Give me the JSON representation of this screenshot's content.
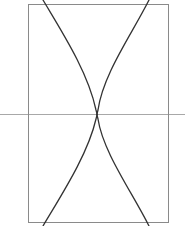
{
  "figure": {
    "canvas": {
      "width": 185,
      "height": 226,
      "background_color": "#ffffff"
    },
    "frame": {
      "name": "bounding-rectangle",
      "x": 28,
      "y": 4,
      "width": 140,
      "height": 218,
      "stroke_color": "#8a8a8a",
      "stroke_width": 1,
      "fill": "none"
    },
    "axis_line": {
      "name": "horizontal-axis",
      "x1": 0,
      "y1": 114.5,
      "x2": 185,
      "y2": 114.5,
      "stroke_color": "#a8a8a8",
      "stroke_width": 1
    },
    "waist": {
      "x": 97,
      "y": 114.5,
      "label": "crossing-point"
    },
    "curves": [
      {
        "name": "upper-left-arc",
        "stroke_color": "#333333",
        "stroke_width": 1.3,
        "path": "M 43 0 C 62 32 88 72 96 110 C 96.6 112 97 113.5 97 114.5"
      },
      {
        "name": "upper-right-arc",
        "stroke_color": "#333333",
        "stroke_width": 1.3,
        "path": "M 149 0 C 132 34 103 74 98 110 C 97.5 112 97 113.5 97 114.5"
      },
      {
        "name": "lower-left-arc",
        "stroke_color": "#333333",
        "stroke_width": 1.3,
        "path": "M 43 226 C 62 194 88 154 96 119 C 96.6 117 97 115.5 97 114.5"
      },
      {
        "name": "lower-right-arc",
        "stroke_color": "#333333",
        "stroke_width": 1.3,
        "path": "M 149 226 C 132 192 103 152 98 119 C 97.5 117 97 115.5 97 114.5"
      }
    ]
  },
  "chart_data": {
    "type": "line",
    "xlabel": "",
    "ylabel": "",
    "xlim": [
      0,
      185
    ],
    "ylim": [
      226,
      0
    ],
    "grid": false,
    "legend": null,
    "annotations": [
      {
        "name": "crossing-point",
        "x": 97,
        "y": 114.5
      }
    ],
    "series": [
      {
        "name": "upper-left-arc",
        "color": "#333333",
        "x": [
          43,
          56,
          70,
          82,
          90,
          94,
          96,
          97
        ],
        "y": [
          0,
          22,
          50,
          76,
          94,
          105,
          111,
          114.5
        ]
      },
      {
        "name": "upper-right-arc",
        "color": "#333333",
        "x": [
          149,
          138,
          124,
          112,
          104,
          100,
          98,
          97
        ],
        "y": [
          0,
          22,
          50,
          76,
          94,
          105,
          111,
          114.5
        ]
      },
      {
        "name": "lower-left-arc",
        "color": "#333333",
        "x": [
          43,
          56,
          70,
          82,
          90,
          94,
          96,
          97
        ],
        "y": [
          226,
          204,
          179,
          153,
          135,
          124,
          118,
          114.5
        ]
      },
      {
        "name": "lower-right-arc",
        "color": "#333333",
        "x": [
          149,
          138,
          124,
          112,
          104,
          100,
          98,
          97
        ],
        "y": [
          226,
          204,
          179,
          153,
          135,
          124,
          118,
          114.5
        ]
      },
      {
        "name": "horizontal-axis",
        "color": "#a8a8a8",
        "x": [
          0,
          185
        ],
        "y": [
          114.5,
          114.5
        ]
      }
    ]
  }
}
